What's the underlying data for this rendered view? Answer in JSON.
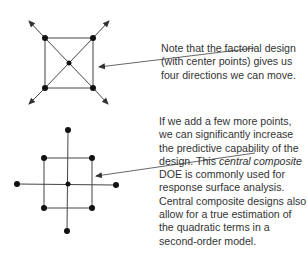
{
  "colors": {
    "line": "#333333",
    "point": "#111111",
    "text": "#333333"
  },
  "notes": {
    "top": "Note that the factorial design (with center points) gives us four directions we can move.",
    "bottom_part1": "If we add a few more points, we can significantly increase the predictive capability of the design. This ",
    "bottom_italic": "central composite",
    "bottom_part2": " DOE is commonly used for response surface analysis. Central composite designs also allow for a true estimation of the quadratic terms in a second-order model."
  },
  "diagrams": {
    "factorial": {
      "label": "factorial design with center point",
      "corner_points": 4,
      "center_points": 1,
      "direction_arrows": 4
    },
    "central_composite": {
      "label": "central composite design",
      "corner_points": 4,
      "center_points": 1,
      "axial_points": 4
    }
  }
}
